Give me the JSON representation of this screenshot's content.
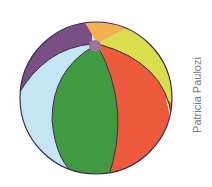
{
  "image": {
    "subject": "beach ball illustration",
    "credit": "Patricia Paulozi"
  },
  "colors": {
    "purple": "#7a4f86",
    "orange": "#f4b04f",
    "yellow": "#d9de4a",
    "light_blue": "#c4e6f4",
    "green": "#3f9a40",
    "red": "#ee5a3c",
    "cap": "#9b7596",
    "outline": "#3a3050"
  }
}
